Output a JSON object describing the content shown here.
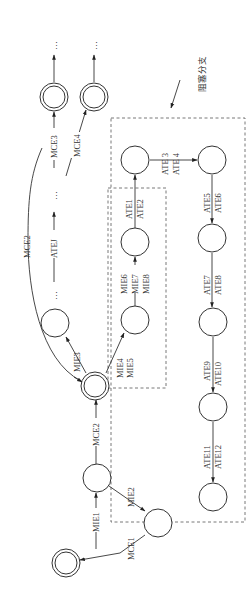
{
  "diagram": {
    "title_annotation": "阻塞分支",
    "ellipsis": "…",
    "nodes": [
      {
        "id": "start",
        "type": "double",
        "x": 66,
        "y": 563
      },
      {
        "id": "n1",
        "type": "single",
        "x": 97,
        "y": 478
      },
      {
        "id": "n_mie2",
        "type": "single",
        "x": 158,
        "y": 523
      },
      {
        "id": "mid",
        "type": "double",
        "x": 95,
        "y": 385
      },
      {
        "id": "n_mie3",
        "type": "single",
        "x": 55,
        "y": 323
      },
      {
        "id": "n_mie4",
        "type": "single",
        "x": 135,
        "y": 320
      },
      {
        "id": "n_mie6",
        "type": "single",
        "x": 135,
        "y": 242
      },
      {
        "id": "n_ate1",
        "type": "single",
        "x": 135,
        "y": 160
      },
      {
        "id": "n_ate3",
        "type": "single",
        "x": 212,
        "y": 160
      },
      {
        "id": "n_ate5",
        "type": "single",
        "x": 212,
        "y": 238
      },
      {
        "id": "n_ate7",
        "type": "single",
        "x": 213,
        "y": 322
      },
      {
        "id": "n_ate9",
        "type": "single",
        "x": 213,
        "y": 407
      },
      {
        "id": "n_ate11",
        "type": "single",
        "x": 213,
        "y": 497
      },
      {
        "id": "top_mce3",
        "type": "double",
        "x": 54,
        "y": 97
      },
      {
        "id": "top_mce4",
        "type": "double",
        "x": 94,
        "y": 97
      }
    ],
    "edge_labels": {
      "mie1": "MIE1",
      "mie2": "MIE2",
      "mce1": "MCE1",
      "mce2_straight": "MCE2",
      "mce2_curve": "MCE2",
      "mie3": "MIE3",
      "mie4": "MIE4",
      "mie5": "MIE5",
      "mie6": "MIE6",
      "mie7": "MIE7",
      "mie8": "MIE8",
      "ate1": "ATE1",
      "ate2": "ATE2",
      "ate3": "ATE 3",
      "ate4": "ATE 4",
      "ate5": "ATE5",
      "ate6": "ATE6",
      "ate7": "ATE7",
      "ate8": "ATE8",
      "ate9": "ATE9",
      "ate10": "ATE10",
      "ate11": "ATE11",
      "ate12": "ATE12",
      "atej": "ATEJ",
      "mce3": "MCE3",
      "mce4": "MCE4"
    }
  }
}
